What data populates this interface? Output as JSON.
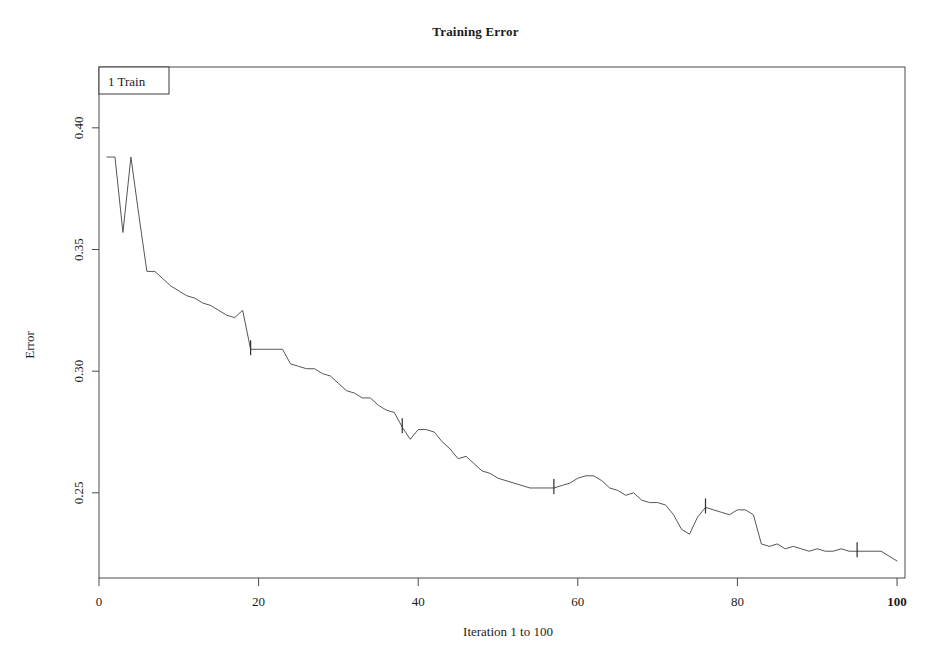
{
  "chart_data": {
    "type": "line",
    "title": "Training Error",
    "xlabel": "Iteration 1 to 100",
    "ylabel": "Error",
    "xlim": [
      0,
      101
    ],
    "ylim": [
      0.215,
      0.425
    ],
    "xticks": [
      0,
      20,
      40,
      60,
      80,
      100
    ],
    "xticklabels": [
      "0",
      "20",
      "40",
      "60",
      "80",
      "100"
    ],
    "xtick_emphasis": "100",
    "yticks": [
      0.25,
      0.3,
      0.35,
      0.4
    ],
    "yticklabels": [
      "0.25",
      "0.30",
      "0.35",
      "0.40"
    ],
    "grid": false,
    "frame": true,
    "legend": {
      "position": "top-left-inside",
      "entries": [
        {
          "label": "1 Train"
        }
      ]
    },
    "line_color": "#555555",
    "line_width": 1,
    "series": [
      {
        "name": "1 Train",
        "x": [
          1,
          2,
          3,
          4,
          5,
          6,
          7,
          8,
          9,
          10,
          11,
          12,
          13,
          14,
          15,
          16,
          17,
          18,
          19,
          20,
          21,
          22,
          23,
          24,
          25,
          26,
          27,
          28,
          29,
          30,
          31,
          32,
          33,
          34,
          35,
          36,
          37,
          38,
          39,
          40,
          41,
          42,
          43,
          44,
          45,
          46,
          47,
          48,
          49,
          50,
          51,
          52,
          53,
          54,
          55,
          56,
          57,
          58,
          59,
          60,
          61,
          62,
          63,
          64,
          65,
          66,
          67,
          68,
          69,
          70,
          71,
          72,
          73,
          74,
          75,
          76,
          77,
          78,
          79,
          80,
          81,
          82,
          83,
          84,
          85,
          86,
          87,
          88,
          89,
          90,
          91,
          92,
          93,
          94,
          95,
          96,
          97,
          98,
          99,
          100
        ],
        "values": [
          0.388,
          0.388,
          0.357,
          0.388,
          0.364,
          0.341,
          0.341,
          0.338,
          0.335,
          0.333,
          0.331,
          0.33,
          0.328,
          0.327,
          0.325,
          0.323,
          0.322,
          0.325,
          0.309,
          0.309,
          0.309,
          0.309,
          0.309,
          0.303,
          0.302,
          0.301,
          0.301,
          0.299,
          0.298,
          0.295,
          0.292,
          0.291,
          0.289,
          0.289,
          0.286,
          0.284,
          0.283,
          0.277,
          0.272,
          0.276,
          0.276,
          0.275,
          0.271,
          0.268,
          0.264,
          0.265,
          0.262,
          0.259,
          0.258,
          0.256,
          0.255,
          0.254,
          0.253,
          0.252,
          0.252,
          0.252,
          0.252,
          0.253,
          0.254,
          0.256,
          0.257,
          0.257,
          0.255,
          0.252,
          0.251,
          0.249,
          0.25,
          0.247,
          0.246,
          0.246,
          0.245,
          0.241,
          0.235,
          0.233,
          0.24,
          0.244,
          0.243,
          0.242,
          0.241,
          0.243,
          0.243,
          0.241,
          0.229,
          0.228,
          0.229,
          0.227,
          0.228,
          0.227,
          0.226,
          0.227,
          0.226,
          0.226,
          0.227,
          0.226,
          0.226,
          0.226,
          0.226,
          0.226,
          0.224,
          0.222
        ],
        "markers_at_x": [
          19,
          38,
          57,
          76,
          95
        ]
      }
    ]
  }
}
